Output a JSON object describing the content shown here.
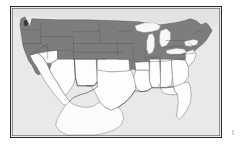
{
  "figure": {
    "kind": "choropleth-map",
    "title": "",
    "caption": "",
    "region": "Contiguous United States",
    "projection": "equirectangular-approximate"
  },
  "colors": {
    "shaded_state": "#7d7d7d",
    "unshaded_state": "#fdfdfd",
    "neighbor_land": "#fbfbfb",
    "water_ocean": "#e9e9e9",
    "great_lakes": "#f7f7f7",
    "border_line": "#2b2b2b",
    "state_line": "#555555",
    "frame": "#2b2b2b",
    "page_background": "#ffffff"
  },
  "legend": {
    "visible": false,
    "entries": [
      {
        "label": "",
        "swatch": "#7d7d7d",
        "meaning": "shaded (dark gray) states"
      },
      {
        "label": "",
        "swatch": "#fdfdfd",
        "meaning": "unshaded (white) states"
      }
    ]
  },
  "map_data": {
    "type": "choropleth",
    "value_scale": "binary",
    "categories": [
      "shaded",
      "unshaded"
    ],
    "states": [
      {
        "code": "WA",
        "name": "Washington",
        "value": "shaded"
      },
      {
        "code": "OR",
        "name": "Oregon",
        "value": "shaded"
      },
      {
        "code": "ID",
        "name": "Idaho",
        "value": "shaded"
      },
      {
        "code": "MT",
        "name": "Montana",
        "value": "shaded"
      },
      {
        "code": "WY",
        "name": "Wyoming",
        "value": "shaded"
      },
      {
        "code": "ND",
        "name": "North Dakota",
        "value": "shaded"
      },
      {
        "code": "SD",
        "name": "South Dakota",
        "value": "shaded"
      },
      {
        "code": "NE",
        "name": "Nebraska",
        "value": "shaded"
      },
      {
        "code": "MN",
        "name": "Minnesota",
        "value": "shaded"
      },
      {
        "code": "IA",
        "name": "Iowa",
        "value": "shaded"
      },
      {
        "code": "WI",
        "name": "Wisconsin",
        "value": "shaded"
      },
      {
        "code": "MI",
        "name": "Michigan",
        "value": "shaded"
      },
      {
        "code": "IL",
        "name": "Illinois",
        "value": "shaded"
      },
      {
        "code": "IN",
        "name": "Indiana",
        "value": "shaded"
      },
      {
        "code": "OH",
        "name": "Ohio",
        "value": "shaded"
      },
      {
        "code": "PA",
        "name": "Pennsylvania",
        "value": "shaded"
      },
      {
        "code": "NY",
        "name": "New York",
        "value": "shaded"
      },
      {
        "code": "VT",
        "name": "Vermont",
        "value": "shaded"
      },
      {
        "code": "NH",
        "name": "New Hampshire",
        "value": "shaded"
      },
      {
        "code": "ME",
        "name": "Maine",
        "value": "shaded"
      },
      {
        "code": "MA",
        "name": "Massachusetts",
        "value": "shaded"
      },
      {
        "code": "CT",
        "name": "Connecticut",
        "value": "shaded"
      },
      {
        "code": "RI",
        "name": "Rhode Island",
        "value": "shaded"
      },
      {
        "code": "NJ",
        "name": "New Jersey",
        "value": "shaded"
      },
      {
        "code": "DE",
        "name": "Delaware",
        "value": "shaded"
      },
      {
        "code": "MD",
        "name": "Maryland",
        "value": "shaded"
      },
      {
        "code": "WV",
        "name": "West Virginia",
        "value": "shaded"
      },
      {
        "code": "VA",
        "name": "Virginia",
        "value": "shaded"
      },
      {
        "code": "KY",
        "name": "Kentucky",
        "value": "shaded"
      },
      {
        "code": "MO",
        "name": "Missouri",
        "value": "shaded"
      },
      {
        "code": "KS",
        "name": "Kansas",
        "value": "shaded"
      },
      {
        "code": "CO",
        "name": "Colorado",
        "value": "shaded"
      },
      {
        "code": "UT",
        "name": "Utah",
        "value": "shaded"
      },
      {
        "code": "NV",
        "name": "Nevada",
        "value": "shaded"
      },
      {
        "code": "TN",
        "name": "Tennessee",
        "value": "shaded"
      },
      {
        "code": "NC",
        "name": "North Carolina",
        "value": "shaded"
      },
      {
        "code": "SC",
        "name": "South Carolina",
        "value": "shaded"
      },
      {
        "code": "AR",
        "name": "Arkansas",
        "value": "shaded"
      },
      {
        "code": "CA",
        "name": "California",
        "value": "unshaded"
      },
      {
        "code": "AZ",
        "name": "Arizona",
        "value": "unshaded"
      },
      {
        "code": "NM",
        "name": "New Mexico",
        "value": "unshaded"
      },
      {
        "code": "OK",
        "name": "Oklahoma",
        "value": "unshaded"
      },
      {
        "code": "TX",
        "name": "Texas",
        "value": "unshaded"
      },
      {
        "code": "LA",
        "name": "Louisiana",
        "value": "unshaded"
      },
      {
        "code": "MS",
        "name": "Mississippi",
        "value": "unshaded"
      },
      {
        "code": "AL",
        "name": "Alabama",
        "value": "unshaded"
      },
      {
        "code": "GA",
        "name": "Georgia",
        "value": "unshaded"
      },
      {
        "code": "FL",
        "name": "Florida",
        "value": "unshaded"
      }
    ],
    "water_features": [
      {
        "name": "Lake Superior"
      },
      {
        "name": "Lake Michigan"
      },
      {
        "name": "Lake Huron"
      },
      {
        "name": "Lake Erie"
      },
      {
        "name": "Lake Ontario"
      },
      {
        "name": "Pacific Ocean"
      },
      {
        "name": "Atlantic Ocean"
      },
      {
        "name": "Gulf of Mexico"
      }
    ],
    "neighbors": [
      {
        "name": "Mexico",
        "value": "unshaded"
      },
      {
        "name": "Canada",
        "value": "background"
      }
    ]
  }
}
